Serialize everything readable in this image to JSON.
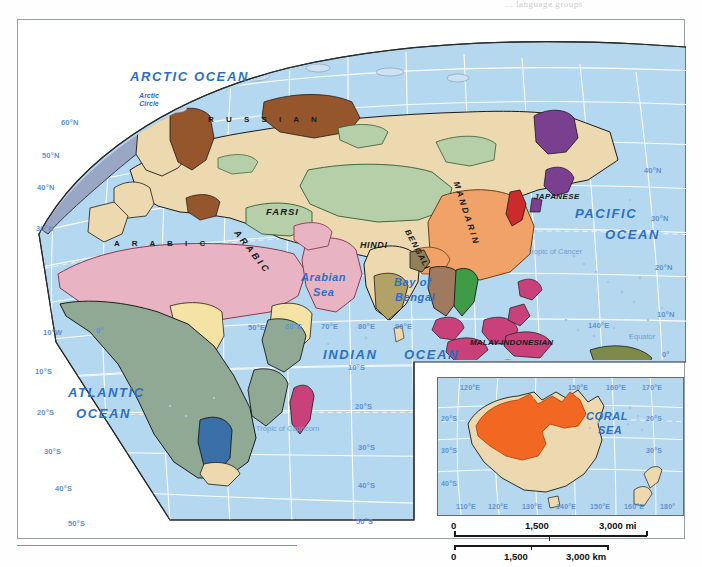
{
  "meta": {
    "cutoff_text": "... language groups"
  },
  "oceans": [
    {
      "name": "ARCTIC OCEAN",
      "size": "lg"
    },
    {
      "name": "PACIFIC",
      "size": "lg"
    },
    {
      "name": "OCEAN",
      "size": "lg"
    },
    {
      "name": "ATLANTIC",
      "size": "lg"
    },
    {
      "name": "OCEAN",
      "size": "lg"
    },
    {
      "name": "INDIAN",
      "size": "lg"
    },
    {
      "name": "OCEAN",
      "size": "lg"
    },
    {
      "name": "Arabian",
      "size": "md"
    },
    {
      "name": "Sea",
      "size": "md"
    },
    {
      "name": "Bay of",
      "size": "md"
    },
    {
      "name": "Bengal",
      "size": "md"
    },
    {
      "name": "CORAL",
      "size": "md"
    },
    {
      "name": "SEA",
      "size": "md"
    }
  ],
  "ocean_labels": {
    "arctic_ocean": "ARCTIC OCEAN",
    "pacific": "PACIFIC",
    "pacific_ocean": "OCEAN",
    "atlantic": "ATLANTIC",
    "atlantic_ocean": "OCEAN",
    "indian": "INDIAN",
    "indian_ocean": "OCEAN",
    "arabian_sea_1": "Arabian",
    "arabian_sea_2": "Sea",
    "bay_of_bengal_1": "Bay of",
    "bay_of_bengal_2": "Bengal",
    "coral_sea_1": "CORAL",
    "coral_sea_2": "SEA"
  },
  "languages": [
    {
      "label": "RUSSIAN",
      "style": "spaced"
    },
    {
      "label": "ARABIC",
      "style": "spaced"
    },
    {
      "label": "ARABIC",
      "style": "rotated"
    },
    {
      "label": "FARSI",
      "style": "plain"
    },
    {
      "label": "HINDI",
      "style": "plain"
    },
    {
      "label": "BENGALI",
      "style": "rotated"
    },
    {
      "label": "MANDARIN",
      "style": "rotated"
    },
    {
      "label": "JAPANESE",
      "style": "plain"
    },
    {
      "label": "MALAY-INDONESIAN",
      "style": "plain"
    }
  ],
  "language_labels": {
    "russian": "R  U  S  S  I  A  N",
    "arabic_africa": "A  R  A  B  I  C",
    "arabic_arabia": "ARABIC",
    "farsi": "FARSI",
    "hindi": "HINDI",
    "bengali": "BENGALI",
    "mandarin": "MANDARIN",
    "japanese": "JAPANESE",
    "malay_indonesian": "MALAY-INDONESIAN"
  },
  "reference_lines": {
    "arctic_circle_1": "Arctic",
    "arctic_circle_2": "Circle",
    "tropic_of_cancer": "Tropic of Cancer",
    "tropic_of_capricorn": "Tropic of Capricorn",
    "equator": "Equator"
  },
  "graticule": {
    "left_latitudes": [
      "60°N",
      "50°N",
      "40°N",
      "30°N",
      "10°S",
      "20°S",
      "30°S",
      "40°S",
      "50°S"
    ],
    "right_latitudes": [
      "40°N",
      "30°N",
      "20°N",
      "10°N",
      "0°"
    ],
    "mid_latitudes": [
      "10°S",
      "20°S",
      "30°S",
      "40°S",
      "50°S"
    ],
    "longitudes": [
      "10°W",
      "0°",
      "50°E",
      "60°E",
      "70°E",
      "80°E",
      "90°E",
      "140°E"
    ]
  },
  "inset": {
    "title": "Australia",
    "top_longitudes": [
      "120°E",
      "150°E",
      "160°E",
      "170°E"
    ],
    "bottom_longitudes": [
      "110°E",
      "120°E",
      "130°E",
      "140°E",
      "150°E",
      "160°E",
      "180°"
    ],
    "left_latitudes": [
      "20°S",
      "30°S",
      "40°S"
    ],
    "right_latitudes": [
      "20°S",
      "30°S"
    ],
    "sea_label_1": "CORAL",
    "sea_label_2": "SEA"
  },
  "scale_bars": {
    "miles": {
      "ticks": [
        "0",
        "1,500",
        "3,000 mi"
      ],
      "unit": "mi"
    },
    "kilometers": {
      "ticks": [
        "0",
        "1,500",
        "3,000 km"
      ],
      "unit": "km"
    }
  },
  "colors": {
    "ocean": "#b6d8ef",
    "ocean_deep": "#a8cfe9",
    "land_tan": "#ecd9b0",
    "arabic_pink": "#e8b4c4",
    "african_sage": "#8fa994",
    "mandarin_orange": "#f0a268",
    "turkic_green": "#b6cfa8",
    "uralic_brown": "#96562b",
    "japanese_purple": "#7a3f8f",
    "malay_magenta": "#c8417a",
    "vietnamese_green": "#3f9b46",
    "korean_red": "#cc2b2b",
    "hindi_olive": "#b3a267",
    "bantu_blue": "#3a6fa8",
    "aboriginal_orange": "#f26722",
    "graticule": "#ffffff",
    "coastline": "#1a1a1a",
    "frame": "#9aa0a6",
    "trim_red": "#e04a2a"
  }
}
